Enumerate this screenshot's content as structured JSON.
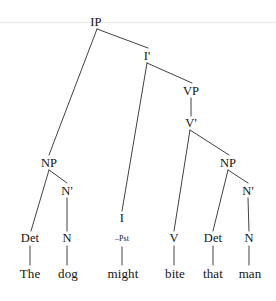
{
  "figure": {
    "name": "syntax-tree-diagram",
    "sentence": "The dog might bite that man",
    "stroke_color": "#2b2b2b",
    "text_color": "#141414",
    "background_color": "#ffffff",
    "rule_color": "#e8e8e8"
  },
  "nodes": [
    {
      "id": "ip",
      "label": "IP",
      "x": 96,
      "y": 22,
      "kind": "cat"
    },
    {
      "id": "i-bar",
      "label": "I'",
      "x": 147,
      "y": 56,
      "kind": "cat"
    },
    {
      "id": "vp",
      "label": "VP",
      "x": 191,
      "y": 91,
      "kind": "cat"
    },
    {
      "id": "v-bar",
      "label": "V'",
      "x": 191,
      "y": 123,
      "kind": "cat"
    },
    {
      "id": "np-subj",
      "label": "NP",
      "x": 49,
      "y": 163,
      "kind": "cat"
    },
    {
      "id": "n-bar-1",
      "label": "N'",
      "x": 67,
      "y": 191,
      "kind": "cat"
    },
    {
      "id": "np-obj",
      "label": "NP",
      "x": 228,
      "y": 163,
      "kind": "cat"
    },
    {
      "id": "n-bar-2",
      "label": "N'",
      "x": 248,
      "y": 191,
      "kind": "cat"
    },
    {
      "id": "det-1",
      "label": "Det",
      "x": 30,
      "y": 238,
      "kind": "cat"
    },
    {
      "id": "n-1",
      "label": "N",
      "x": 67,
      "y": 238,
      "kind": "cat"
    },
    {
      "id": "i",
      "label": "I",
      "x": 122,
      "y": 218,
      "kind": "cat"
    },
    {
      "id": "pst",
      "label": "–Pst",
      "x": 122,
      "y": 239,
      "kind": "feat"
    },
    {
      "id": "v",
      "label": "V",
      "x": 174,
      "y": 238,
      "kind": "cat"
    },
    {
      "id": "det-2",
      "label": "Det",
      "x": 213,
      "y": 238,
      "kind": "cat"
    },
    {
      "id": "n-2",
      "label": "N",
      "x": 249,
      "y": 238,
      "kind": "cat"
    },
    {
      "id": "word-the",
      "label": "The",
      "x": 30,
      "y": 273,
      "kind": "word"
    },
    {
      "id": "word-dog",
      "label": "dog",
      "x": 68,
      "y": 273,
      "kind": "word"
    },
    {
      "id": "word-might",
      "label": "might",
      "x": 123,
      "y": 273,
      "kind": "word"
    },
    {
      "id": "word-bite",
      "label": "bite",
      "x": 175,
      "y": 273,
      "kind": "word"
    },
    {
      "id": "word-that",
      "label": "that",
      "x": 213,
      "y": 273,
      "kind": "word"
    },
    {
      "id": "word-man",
      "label": "man",
      "x": 250,
      "y": 273,
      "kind": "word"
    }
  ],
  "edges": [
    {
      "id": "ip-to-np-subj",
      "x1": 97,
      "y1": 29,
      "x2": 49,
      "y2": 155
    },
    {
      "id": "ip-to-i-bar",
      "x1": 97,
      "y1": 29,
      "x2": 148,
      "y2": 48
    },
    {
      "id": "i-bar-to-i",
      "x1": 147,
      "y1": 63,
      "x2": 122,
      "y2": 211
    },
    {
      "id": "i-bar-to-vp",
      "x1": 147,
      "y1": 63,
      "x2": 192,
      "y2": 83
    },
    {
      "id": "vp-to-v-bar",
      "x1": 191,
      "y1": 98,
      "x2": 191,
      "y2": 116
    },
    {
      "id": "v-bar-to-v",
      "x1": 190,
      "y1": 130,
      "x2": 174,
      "y2": 231
    },
    {
      "id": "v-bar-to-np",
      "x1": 190,
      "y1": 130,
      "x2": 229,
      "y2": 155
    },
    {
      "id": "np-subj-to-det",
      "x1": 49,
      "y1": 170,
      "x2": 31,
      "y2": 231
    },
    {
      "id": "np-subj-to-nbar",
      "x1": 49,
      "y1": 170,
      "x2": 67,
      "y2": 183
    },
    {
      "id": "n-bar-1-to-n",
      "x1": 67,
      "y1": 198,
      "x2": 67,
      "y2": 231
    },
    {
      "id": "np-obj-to-det",
      "x1": 228,
      "y1": 170,
      "x2": 213,
      "y2": 231
    },
    {
      "id": "np-obj-to-nbar",
      "x1": 228,
      "y1": 170,
      "x2": 248,
      "y2": 183
    },
    {
      "id": "n-bar-2-to-n",
      "x1": 248,
      "y1": 198,
      "x2": 249,
      "y2": 231
    },
    {
      "id": "det-1-to-word",
      "x1": 30,
      "y1": 246,
      "x2": 30,
      "y2": 265
    },
    {
      "id": "n-1-to-word",
      "x1": 67,
      "y1": 246,
      "x2": 67,
      "y2": 265
    },
    {
      "id": "i-to-word",
      "x1": 122,
      "y1": 247,
      "x2": 122,
      "y2": 265
    },
    {
      "id": "v-to-word",
      "x1": 174,
      "y1": 246,
      "x2": 174,
      "y2": 265
    },
    {
      "id": "det-2-to-word",
      "x1": 213,
      "y1": 246,
      "x2": 213,
      "y2": 265
    },
    {
      "id": "n-2-to-word",
      "x1": 249,
      "y1": 246,
      "x2": 249,
      "y2": 265
    }
  ],
  "rule": {
    "id": "top-hairline",
    "x1": 0,
    "y1": 22.5,
    "x2": 276,
    "y2": 22.5
  }
}
